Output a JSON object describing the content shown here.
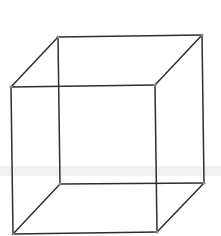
{
  "diagram": {
    "type": "wireframe-cube",
    "colors": {
      "background": "#ffffff",
      "edge": "#2e2e2e",
      "vertex": "#8a8a8a"
    },
    "vertices": {
      "back_top_left": [
        58,
        37
      ],
      "back_top_right": [
        202,
        35
      ],
      "front_top_left": [
        11,
        87
      ],
      "front_top_right": [
        155,
        85
      ],
      "back_bottom_left": [
        60,
        184
      ],
      "back_bottom_right": [
        204,
        183
      ],
      "front_bottom_left": [
        13,
        234
      ],
      "front_bottom_right": [
        157,
        232
      ]
    },
    "edges": [
      [
        "back_top_left",
        "back_top_right"
      ],
      [
        "back_top_right",
        "back_bottom_right"
      ],
      [
        "back_bottom_right",
        "back_bottom_left"
      ],
      [
        "back_bottom_left",
        "back_top_left"
      ],
      [
        "front_top_left",
        "front_top_right"
      ],
      [
        "front_top_right",
        "front_bottom_right"
      ],
      [
        "front_bottom_right",
        "front_bottom_left"
      ],
      [
        "front_bottom_left",
        "front_top_left"
      ],
      [
        "front_top_left",
        "back_top_left"
      ],
      [
        "front_top_right",
        "back_top_right"
      ],
      [
        "front_bottom_left",
        "back_bottom_left"
      ],
      [
        "front_bottom_right",
        "back_bottom_right"
      ]
    ]
  }
}
